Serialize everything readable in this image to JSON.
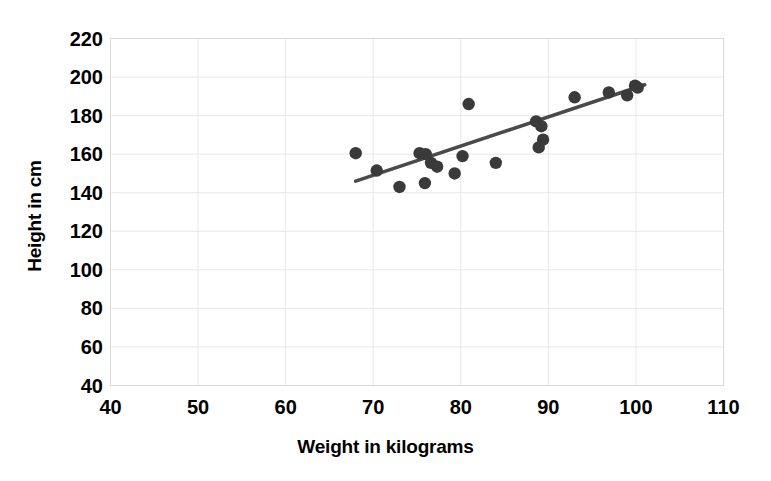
{
  "chart_data": {
    "type": "scatter",
    "title": "",
    "xlabel": "Weight in kilograms",
    "ylabel": "Height in cm",
    "xlim": [
      40,
      110
    ],
    "ylim": [
      40,
      220
    ],
    "xticks": [
      40,
      50,
      60,
      70,
      80,
      90,
      100,
      110
    ],
    "yticks": [
      40,
      60,
      80,
      100,
      120,
      140,
      160,
      180,
      200,
      220
    ],
    "grid": true,
    "legend": null,
    "marker_color": "#3a3a3a",
    "trendline_color": "#4a4a4a",
    "gridline_color": "#e8e8e8",
    "points": [
      {
        "x": 68.0,
        "y": 160.5
      },
      {
        "x": 70.4,
        "y": 151.5
      },
      {
        "x": 73.0,
        "y": 143.0
      },
      {
        "x": 75.3,
        "y": 160.5
      },
      {
        "x": 76.0,
        "y": 160.0
      },
      {
        "x": 75.9,
        "y": 145.0
      },
      {
        "x": 76.6,
        "y": 155.5
      },
      {
        "x": 77.3,
        "y": 153.5
      },
      {
        "x": 79.3,
        "y": 150.0
      },
      {
        "x": 80.2,
        "y": 159.0
      },
      {
        "x": 80.9,
        "y": 186.0
      },
      {
        "x": 84.0,
        "y": 155.5
      },
      {
        "x": 88.6,
        "y": 177.0
      },
      {
        "x": 89.2,
        "y": 174.5
      },
      {
        "x": 89.4,
        "y": 167.5
      },
      {
        "x": 88.9,
        "y": 163.5
      },
      {
        "x": 93.0,
        "y": 189.5
      },
      {
        "x": 96.9,
        "y": 192.0
      },
      {
        "x": 99.0,
        "y": 190.5
      },
      {
        "x": 99.9,
        "y": 195.5
      },
      {
        "x": 100.2,
        "y": 194.5
      }
    ],
    "trendline": {
      "x1": 68.0,
      "y1": 146.0,
      "x2": 101.0,
      "y2": 196.0
    }
  }
}
